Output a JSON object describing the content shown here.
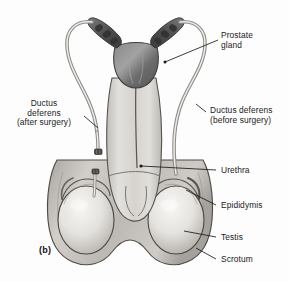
{
  "figure": {
    "id_label": "(b)",
    "style": "grayscale-medical-illustration"
  },
  "labels": {
    "prostate_gland": {
      "text": "Prostate\ngland",
      "align": "left"
    },
    "ductus_after_surgery": {
      "text": "Ductus\ndeferens\n(after surgery)",
      "align": "center"
    },
    "ductus_before_surgery": {
      "text": "Ductus deferens\n(before surgery)",
      "align": "left"
    },
    "urethra": {
      "text": "Urethra",
      "align": "left"
    },
    "epididymis": {
      "text": "Epididymis",
      "align": "left"
    },
    "testis": {
      "text": "Testis",
      "align": "left"
    },
    "scrotum": {
      "text": "Scrotum",
      "align": "left"
    }
  },
  "colors": {
    "background": "#fdfdfd",
    "leader_line": "#1a1a1a",
    "outline": "#4a4a4a",
    "prostate_dark": "#6e6e6e",
    "seminal_vesicle_dark": "#545454",
    "shaft_light": "#d8d6d2",
    "testis_light": "#eceae6",
    "scrotum_mid": "#b8b5b0",
    "duct_tube": "#c9c7c3",
    "text": "#1a1a1a"
  },
  "structures": [
    {
      "name": "seminal-vesicle-left",
      "description": "dark lobulated gland angled upper-left"
    },
    {
      "name": "seminal-vesicle-right",
      "description": "dark lobulated gland angled upper-right"
    },
    {
      "name": "prostate-gland",
      "description": "dark rounded gland below vesicles"
    },
    {
      "name": "ductus-deferens-left",
      "description": "tube arcing left, severed with two ligature clips"
    },
    {
      "name": "ductus-deferens-right",
      "description": "tube arcing right, intact and continuous"
    },
    {
      "name": "penis-shaft",
      "description": "central light column with urethra line"
    },
    {
      "name": "urethra",
      "description": "vertical channel through shaft"
    },
    {
      "name": "testis-left",
      "description": "pale oval within left scrotal sac"
    },
    {
      "name": "testis-right",
      "description": "pale oval within right scrotal sac"
    },
    {
      "name": "epididymis-left",
      "description": "crescent cap over left testis"
    },
    {
      "name": "epididymis-right",
      "description": "crescent cap over right testis"
    },
    {
      "name": "scrotum",
      "description": "double-lobed sac enclosing both testes"
    },
    {
      "name": "vasectomy-clip-upper",
      "description": "cut and tied end of left ductus deferens"
    },
    {
      "name": "vasectomy-clip-lower",
      "description": "cut and tied stump toward left epididymis"
    }
  ]
}
